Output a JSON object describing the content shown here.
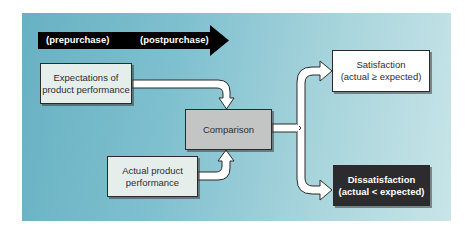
{
  "diagram": {
    "timeline": {
      "labels": [
        "(prepurchase)",
        "(postpurchase)"
      ],
      "color": "#000000"
    },
    "nodes": {
      "expectations": {
        "line1": "Expectations of",
        "line2": "product performance"
      },
      "actual": {
        "line1": "Actual product",
        "line2": "performance"
      },
      "comparison": {
        "label": "Comparison"
      },
      "satisfaction": {
        "line1": "Satisfaction",
        "line2": "(actual ≥ expected)"
      },
      "dissatisfaction": {
        "line1": "Dissatisfaction",
        "line2": "(actual < expected)"
      }
    },
    "edges": [
      {
        "from": "expectations",
        "to": "comparison"
      },
      {
        "from": "actual",
        "to": "comparison"
      },
      {
        "from": "comparison",
        "to": "satisfaction"
      },
      {
        "from": "comparison",
        "to": "dissatisfaction"
      }
    ],
    "colors": {
      "background_left": "#67b1c3",
      "background_right": "#c8e5e8",
      "comparison_fill": "#c3c5c4",
      "dissatisfaction_fill": "#2c2b2e",
      "input_fill": "#e6eeec"
    }
  }
}
